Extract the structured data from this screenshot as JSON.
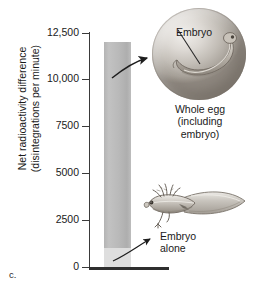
{
  "panel": {
    "letter": "c."
  },
  "axis": {
    "y_title": "Net radioactivity difference\n(disintegrations per minute)",
    "tick_labels": [
      "12,500",
      "10,000",
      "7500",
      "5000",
      "2500",
      "0"
    ]
  },
  "annotations": {
    "embryo_in_egg_label": "Embryo",
    "whole_egg_caption": "Whole egg\n(including\nembryo)",
    "embryo_alone_label": "Embryo\nalone"
  },
  "icons": {
    "egg": "egg-illustration",
    "tadpole": "larva-illustration",
    "arrow_to_egg": "curved-arrow-icon",
    "arrow_to_larva": "curved-arrow-icon",
    "pointer_embryo_alone": "arrowhead-icon",
    "leader_embryo": "leader-line-icon"
  },
  "colors": {
    "bar_fill": "#b9b9b9",
    "bar_base_fill": "#dedede",
    "axis": "#3a3a3a",
    "text": "#1a1a1a",
    "egg": "#c2bdb6"
  },
  "chart_data": {
    "type": "bar",
    "title": "",
    "xlabel": "",
    "ylabel": "Net radioactivity difference (disintegrations per minute)",
    "categories": [
      "Whole egg (including embryo)",
      "Embryo alone"
    ],
    "values": [
      12000,
      1000
    ],
    "ylim": [
      0,
      12500
    ],
    "yticks": [
      0,
      2500,
      5000,
      7500,
      10000,
      12500
    ],
    "ytick_labels": [
      "0",
      "2500",
      "5000",
      "7500",
      "10,000",
      "12,500"
    ],
    "grid": false,
    "legend": "none"
  }
}
